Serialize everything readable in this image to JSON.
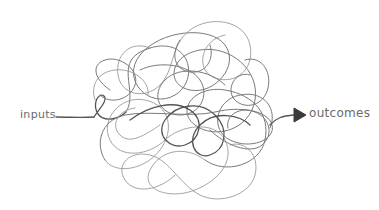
{
  "diagram": {
    "input_label": "inputs",
    "output_label": "outcomes",
    "arrow": "right-triangle-arrow",
    "stroke_color": "#7a7a7a",
    "arrow_color": "#3a3a3a",
    "background": "#ffffff"
  }
}
